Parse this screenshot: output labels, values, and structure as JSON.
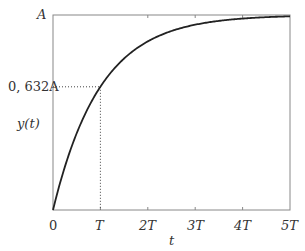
{
  "chart_data": {
    "type": "line",
    "title": "",
    "xlabel": "t",
    "ylabel": "y(t)",
    "function": "y(t) = A(1 - e^(-t/T))",
    "x_ticks": [
      "0",
      "T",
      "2T",
      "3T",
      "4T",
      "5T"
    ],
    "x_tick_values": [
      0,
      1,
      2,
      3,
      4,
      5
    ],
    "y_ticks": [
      "0,632A",
      "A"
    ],
    "y_tick_values": [
      0.632,
      1.0
    ],
    "xlim": [
      0,
      5
    ],
    "ylim": [
      0,
      1
    ],
    "grid": false,
    "legend": null,
    "series": [
      {
        "name": "y(t)",
        "x": [
          0,
          0.25,
          0.5,
          0.75,
          1,
          1.5,
          2,
          2.5,
          3,
          3.5,
          4,
          4.5,
          5
        ],
        "values": [
          0,
          0.221,
          0.393,
          0.528,
          0.632,
          0.777,
          0.865,
          0.918,
          0.95,
          0.97,
          0.982,
          0.989,
          0.993
        ]
      }
    ],
    "annotations": [
      {
        "type": "dotted-hline",
        "y": 0.632,
        "x_from": 0,
        "x_to": 1
      },
      {
        "type": "dotted-vline",
        "x": 1,
        "y_from": 0,
        "y_to": 0.632
      }
    ]
  },
  "labels": {
    "y_top": "A",
    "y_mark": "0, 632A",
    "ylabel": "y(t)",
    "xlabel": "t",
    "x0": "0",
    "x1": "T",
    "x2": "2T",
    "x3": "3T",
    "x4": "4T",
    "x5": "5T"
  }
}
